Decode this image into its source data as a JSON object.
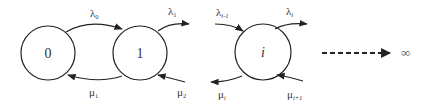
{
  "diagram": {
    "type": "birth-death state transition diagram",
    "states": [
      {
        "id": "0",
        "label": "0"
      },
      {
        "id": "1",
        "label": "1"
      },
      {
        "id": "i",
        "label": "i"
      }
    ],
    "transitions": [
      {
        "from": "0",
        "to": "1",
        "symbol": "λ",
        "subscript": "0"
      },
      {
        "from": "1",
        "to": "0",
        "symbol": "μ",
        "subscript": "1"
      },
      {
        "from": "1",
        "to": "next",
        "symbol": "λ",
        "subscript": "1"
      },
      {
        "from": "next",
        "to": "1",
        "symbol": "μ",
        "subscript": "2"
      },
      {
        "from": "prev",
        "to": "i",
        "symbol": "λ",
        "subscript": "i-1"
      },
      {
        "from": "i",
        "to": "next",
        "symbol": "λ",
        "subscript": "i"
      },
      {
        "from": "i",
        "to": "prev",
        "symbol": "μ",
        "subscript": "i"
      },
      {
        "from": "next",
        "to": "i",
        "symbol": "μ",
        "subscript": "i+1"
      }
    ],
    "continuation": {
      "style": "dashed-arrow",
      "label": "∞"
    },
    "colors": {
      "stroke": "#222222",
      "text": "#333333"
    }
  }
}
